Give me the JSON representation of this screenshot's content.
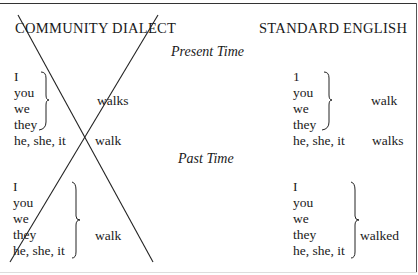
{
  "headers": {
    "left": "COMMUNITY DIALECT",
    "right": "STANDARD ENGLISH"
  },
  "sections": {
    "present": {
      "title": "Present Time",
      "community": {
        "group_pronouns": [
          "I",
          "you",
          "we",
          "they"
        ],
        "group_verb": "walks",
        "single_pronoun": "he, she, it",
        "single_verb": "walk"
      },
      "standard": {
        "group_pronouns": [
          "1",
          "you",
          "we",
          "they"
        ],
        "group_verb": "walk",
        "single_pronoun": "he, she, it",
        "single_verb": "walks"
      }
    },
    "past": {
      "title": "Past Time",
      "community": {
        "pronouns": [
          "I",
          "you",
          "we",
          "they",
          "he, she, it"
        ],
        "verb": "walk"
      },
      "standard": {
        "pronouns": [
          "I",
          "you",
          "we",
          "they",
          "he, she, it"
        ],
        "verb": "walked"
      }
    }
  },
  "annotations": {
    "crossed_out_column": "COMMUNITY DIALECT",
    "mark": "large X"
  }
}
